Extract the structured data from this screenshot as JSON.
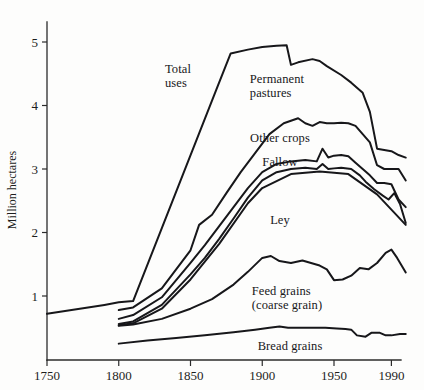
{
  "chart_data": {
    "type": "line",
    "title": "",
    "subtitle": "",
    "xlabel": "",
    "ylabel": "Million hectares",
    "xlim": [
      1750,
      2000
    ],
    "ylim": [
      0,
      5.4
    ],
    "grid": false,
    "legend_position": "inline-annotations",
    "x_ticks": [
      1750,
      1800,
      1850,
      1900,
      1950,
      1990
    ],
    "x_tick_labels": [
      "1750",
      "1800",
      "1850",
      "1900",
      "1950",
      "1990"
    ],
    "y_ticks": [
      1,
      2,
      3,
      4,
      5
    ],
    "y_tick_labels": [
      "1",
      "2",
      "3",
      "4",
      "5"
    ],
    "line_color": "#17171a",
    "series": [
      {
        "name": "Total uses",
        "label": "Total\nuses",
        "label_x": 178,
        "label_y": 62,
        "label_align": "center",
        "x": [
          1750,
          1790,
          1800,
          1810,
          1868,
          1878,
          1890,
          1900,
          1910,
          1917,
          1920,
          1925,
          1935,
          1940,
          1945,
          1955,
          1962,
          1970,
          1975,
          1980,
          1985,
          1990,
          1995,
          2000
        ],
        "values": [
          0.72,
          0.86,
          0.9,
          0.92,
          4.25,
          4.82,
          4.88,
          4.92,
          4.94,
          4.95,
          4.64,
          4.68,
          4.73,
          4.7,
          4.62,
          4.48,
          4.36,
          4.2,
          3.9,
          3.32,
          3.3,
          3.28,
          3.22,
          3.18
        ]
      },
      {
        "name": "Permanent pastures",
        "label": "Permanent\npastures",
        "label_x": 277,
        "label_y": 72,
        "label_align": "center",
        "x": [
          1800,
          1810,
          1830,
          1850,
          1856,
          1865,
          1875,
          1885,
          1895,
          1905,
          1915,
          1925,
          1930,
          1935,
          1940,
          1945,
          1950,
          1955,
          1960,
          1965,
          1970,
          1975,
          1980,
          1985,
          1990,
          1995,
          2000
        ],
        "values": [
          0.78,
          0.82,
          1.12,
          1.72,
          2.12,
          2.28,
          2.62,
          2.95,
          3.25,
          3.55,
          3.72,
          3.8,
          3.72,
          3.68,
          3.74,
          3.72,
          3.72,
          3.73,
          3.72,
          3.68,
          3.55,
          3.42,
          3.06,
          3.0,
          3.0,
          3.0,
          2.82
        ]
      },
      {
        "name": "Other crops",
        "label": "Other crops",
        "label_x": 280,
        "label_y": 131,
        "label_align": "center",
        "x": [
          1800,
          1810,
          1830,
          1850,
          1860,
          1870,
          1880,
          1890,
          1900,
          1910,
          1920,
          1930,
          1938,
          1942,
          1946,
          1950,
          1955,
          1960,
          1965,
          1970,
          1975,
          1980,
          1985,
          1990,
          1995,
          2000
        ],
        "values": [
          0.64,
          0.7,
          0.98,
          1.52,
          1.8,
          2.1,
          2.4,
          2.7,
          2.95,
          3.08,
          3.12,
          3.14,
          3.12,
          3.32,
          3.18,
          3.21,
          3.22,
          3.2,
          3.1,
          3.0,
          2.9,
          2.78,
          2.78,
          2.76,
          2.52,
          2.4
        ]
      },
      {
        "name": "Fallow",
        "label": "Fallow",
        "label_x": 280,
        "label_y": 155,
        "label_align": "center",
        "x": [
          1800,
          1810,
          1830,
          1850,
          1860,
          1870,
          1880,
          1890,
          1900,
          1910,
          1920,
          1930,
          1938,
          1942,
          1946,
          1950,
          1955,
          1962,
          1968,
          1972,
          1978,
          1984,
          1988,
          1992,
          1996,
          2000
        ],
        "values": [
          0.56,
          0.6,
          0.86,
          1.34,
          1.6,
          1.9,
          2.22,
          2.55,
          2.82,
          2.95,
          3.0,
          3.02,
          3.0,
          3.08,
          3.0,
          3.01,
          3.02,
          3.0,
          2.9,
          2.8,
          2.68,
          2.58,
          2.52,
          2.62,
          2.45,
          2.15
        ]
      },
      {
        "name": "Ley",
        "label": "Ley",
        "label_x": 280,
        "label_y": 213,
        "label_align": "center",
        "x": [
          1800,
          1810,
          1830,
          1850,
          1870,
          1890,
          1900,
          1920,
          1940,
          1960,
          1980,
          2000
        ],
        "values": [
          0.54,
          0.57,
          0.8,
          1.26,
          1.82,
          2.46,
          2.7,
          2.92,
          2.96,
          2.92,
          2.6,
          2.12
        ]
      },
      {
        "name": "Feed grains (coarse grain)",
        "label": "Feed grains\n(coarse grain)",
        "label_x": 287,
        "label_y": 284,
        "label_align": "center",
        "x": [
          1800,
          1810,
          1830,
          1850,
          1865,
          1880,
          1890,
          1900,
          1906,
          1912,
          1920,
          1928,
          1934,
          1940,
          1945,
          1950,
          1956,
          1962,
          1968,
          1974,
          1980,
          1986,
          1990,
          1994,
          2000
        ],
        "values": [
          0.53,
          0.55,
          0.64,
          0.8,
          0.95,
          1.18,
          1.38,
          1.6,
          1.63,
          1.55,
          1.52,
          1.56,
          1.52,
          1.48,
          1.42,
          1.25,
          1.26,
          1.32,
          1.44,
          1.42,
          1.52,
          1.68,
          1.73,
          1.6,
          1.37
        ]
      },
      {
        "name": "Bread grains",
        "label": "Bread grains",
        "label_x": 290,
        "label_y": 339,
        "label_align": "center",
        "x": [
          1800,
          1820,
          1840,
          1860,
          1880,
          1895,
          1905,
          1912,
          1918,
          1928,
          1936,
          1944,
          1952,
          1958,
          1962,
          1966,
          1972,
          1976,
          1982,
          1986,
          1990,
          1996,
          2000
        ],
        "values": [
          0.25,
          0.3,
          0.34,
          0.38,
          0.43,
          0.47,
          0.5,
          0.52,
          0.5,
          0.5,
          0.5,
          0.5,
          0.49,
          0.48,
          0.47,
          0.38,
          0.36,
          0.42,
          0.42,
          0.38,
          0.38,
          0.4,
          0.4
        ]
      }
    ]
  }
}
